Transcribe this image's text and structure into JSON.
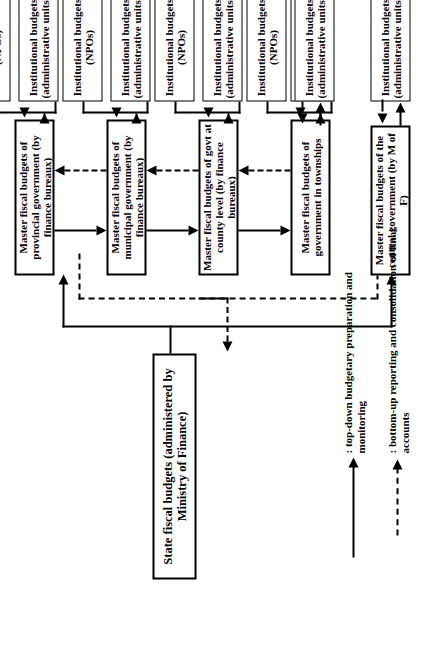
{
  "figure": {
    "orientation": "rotated-90-ccw"
  },
  "nodes": {
    "state": {
      "label": "State fiscal budgets\n(administered by Ministry of Finance)"
    },
    "central_master": {
      "label": "Master fiscal budgets of the\ncentral government (by M of F)"
    },
    "central_admin": {
      "label": "Institutional budgets\n(administrative units)"
    },
    "central_npo": {
      "label": "Institutional budgets\n(NPOs)"
    },
    "levels": [
      {
        "master": "Master fiscal budgets of provincial\ngovernment (by finance bureaux)",
        "admin": "Institutional budgets\n(administrative units)",
        "npo": "Institutional budgets\n(NPOs)"
      },
      {
        "master": "Master fiscal budgets of municipal\ngovernment (by finance bureaux)",
        "admin": "Institutional budgets\n(administrative units)",
        "npo": "Institutional budgets\n(NPOs)"
      },
      {
        "master": "Master fiscal budgets of govt at\ncounty level (by finance bureaux)",
        "admin": "Institutional budgets\n(administrative units)",
        "npo": "Institutional budgets\n(NPOs)"
      },
      {
        "master": "Master fiscal budgets of\ngovernment in townships",
        "admin": "Institutional budgets\n(administrative units)",
        "npo": "Institutional budgets\n(NPOs)"
      }
    ]
  },
  "legend": {
    "solid": ": top-down budgetary preparation and\nmonitoring",
    "dashed": ": bottom-up reporting and consolidation of final\naccounts"
  },
  "colors": {
    "ink": "#000000",
    "paper": "#ffffff"
  }
}
